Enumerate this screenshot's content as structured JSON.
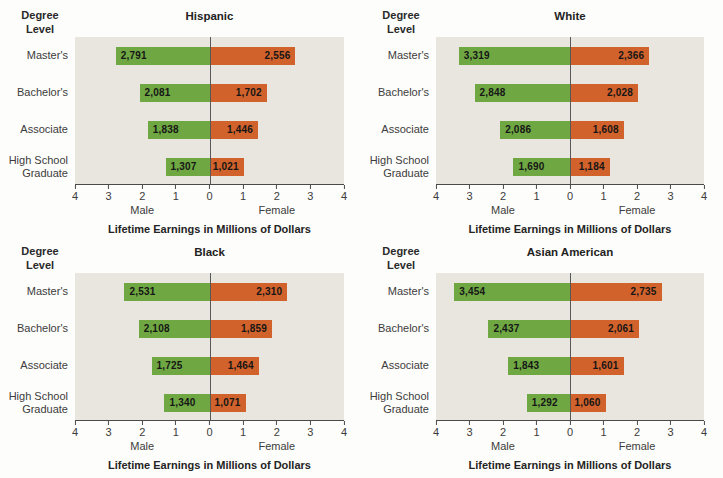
{
  "figure": {
    "degree_level_label": "Degree\nLevel",
    "male_label": "Male",
    "female_label": "Female",
    "xlabel": "Lifetime Earnings in Millions of Dollars"
  },
  "axis": {
    "max_millions": 4,
    "ticks": [
      "4",
      "3",
      "2",
      "1",
      "0",
      "1",
      "2",
      "3",
      "4"
    ]
  },
  "colors": {
    "male_bar": "#6fa843",
    "female_bar": "#d2622b",
    "plot_background": "#e9e6df",
    "axis_line": "#4a4a4a",
    "zero_line": "#58585a"
  },
  "chart_data": [
    {
      "type": "bar",
      "orientation": "diverging-horizontal",
      "title": "Hispanic",
      "xlabel": "Lifetime Earnings in Millions of Dollars",
      "categories": [
        "Master's",
        "Bachelor's",
        "Associate",
        "High School Graduate"
      ],
      "values_are": "thousands of dollars (axis shown in millions)",
      "xlim": [
        -4,
        4
      ],
      "series": [
        {
          "name": "Male",
          "color": "#6fa843",
          "values": [
            2791,
            2081,
            1838,
            1307
          ]
        },
        {
          "name": "Female",
          "color": "#d2622b",
          "values": [
            2556,
            1702,
            1446,
            1021
          ]
        }
      ]
    },
    {
      "type": "bar",
      "orientation": "diverging-horizontal",
      "title": "White",
      "xlabel": "Lifetime Earnings in Millions of Dollars",
      "categories": [
        "Master's",
        "Bachelor's",
        "Associate",
        "High School Graduate"
      ],
      "values_are": "thousands of dollars (axis shown in millions)",
      "xlim": [
        -4,
        4
      ],
      "series": [
        {
          "name": "Male",
          "color": "#6fa843",
          "values": [
            3319,
            2848,
            2086,
            1690
          ]
        },
        {
          "name": "Female",
          "color": "#d2622b",
          "values": [
            2366,
            2028,
            1608,
            1184
          ]
        }
      ]
    },
    {
      "type": "bar",
      "orientation": "diverging-horizontal",
      "title": "Black",
      "xlabel": "Lifetime Earnings in Millions of Dollars",
      "categories": [
        "Master's",
        "Bachelor's",
        "Associate",
        "High School Graduate"
      ],
      "values_are": "thousands of dollars (axis shown in millions)",
      "xlim": [
        -4,
        4
      ],
      "series": [
        {
          "name": "Male",
          "color": "#6fa843",
          "values": [
            2531,
            2108,
            1725,
            1340
          ]
        },
        {
          "name": "Female",
          "color": "#d2622b",
          "values": [
            2310,
            1859,
            1464,
            1071
          ]
        }
      ]
    },
    {
      "type": "bar",
      "orientation": "diverging-horizontal",
      "title": "Asian American",
      "xlabel": "Lifetime Earnings in Millions of Dollars",
      "categories": [
        "Master's",
        "Bachelor's",
        "Associate",
        "High School Graduate"
      ],
      "values_are": "thousands of dollars (axis shown in millions)",
      "xlim": [
        -4,
        4
      ],
      "series": [
        {
          "name": "Male",
          "color": "#6fa843",
          "values": [
            3454,
            2437,
            1843,
            1292
          ]
        },
        {
          "name": "Female",
          "color": "#d2622b",
          "values": [
            2735,
            2061,
            1601,
            1060
          ]
        }
      ]
    }
  ]
}
